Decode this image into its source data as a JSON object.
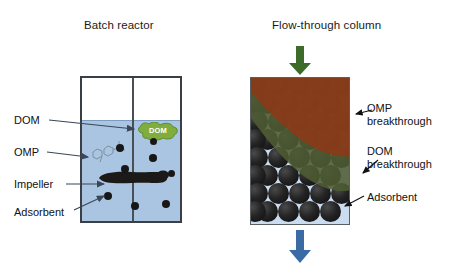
{
  "figure": {
    "width": 452,
    "height": 274,
    "background": "#ffffff"
  },
  "batch_panel": {
    "title": "Batch reactor",
    "labels": {
      "dom": "DOM",
      "omp": "OMP",
      "impeller": "Impeller",
      "adsorbent": "Adsorbent"
    },
    "blob_text": "DOM",
    "colors": {
      "water": "#a9c5e2",
      "vessel_outline": "#3a3f45",
      "dom_blob": "#7fae3f",
      "adsorbent": "#171717",
      "impeller": "#1c1a18"
    }
  },
  "column_panel": {
    "title": "Flow-through column",
    "labels": {
      "omp_breakthrough": "OMP breakthrough",
      "dom_breakthrough": "DOM breakthrough",
      "adsorbent": "Adsorbent"
    },
    "colors": {
      "omp_zone": "#8a3a18",
      "dom_zone": "#4e5c33",
      "bed_background": "#ccdcf0",
      "adsorbent": "#1a1a1a",
      "inlet_arrow": "#3d6b2a",
      "outlet_arrow": "#3a6ba5",
      "outline": "#5a5f63"
    },
    "inlet_arrow_icon": "arrow-down-icon",
    "outlet_arrow_icon": "arrow-down-icon"
  }
}
